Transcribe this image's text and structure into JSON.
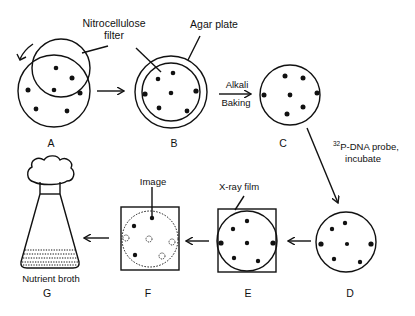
{
  "panels": {
    "A": {
      "label": "A",
      "annotation": "Nitrocellulose filter",
      "annotation_line1": "Nitrocellulose",
      "annotation_line2": "filter"
    },
    "B": {
      "label": "B",
      "annotation": "Agar plate"
    },
    "C": {
      "label": "C"
    },
    "D": {
      "label": "D"
    },
    "E": {
      "label": "E",
      "annotation": "X-ray film"
    },
    "F": {
      "label": "F",
      "annotation": "Image"
    },
    "G": {
      "label": "G",
      "annotation": "Nutrient broth"
    }
  },
  "steps": {
    "b_to_c_line1": "Alkali",
    "b_to_c_line2": "Baking",
    "c_to_d_superscript": "32",
    "c_to_d_line1": "P-DNA probe,",
    "c_to_d_line2": "incubate"
  },
  "colors": {
    "ink": "#111111",
    "background": "#ffffff"
  }
}
